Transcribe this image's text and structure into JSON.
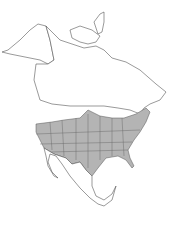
{
  "map": {
    "type": "range-map",
    "region": "North America",
    "colors": {
      "background": "#ffffff",
      "land": "#ffffff",
      "outline": "#555555",
      "range_fill": "#b4b4b4"
    },
    "shaded_range": {
      "description": "Contiguous United States (most states) shaded",
      "extends_into": [
        "southern Canada (small area north of Great Plains)"
      ]
    },
    "unshaded": [
      "Alaska",
      "Canada",
      "Greenland",
      "Mexico",
      "Central America"
    ]
  }
}
